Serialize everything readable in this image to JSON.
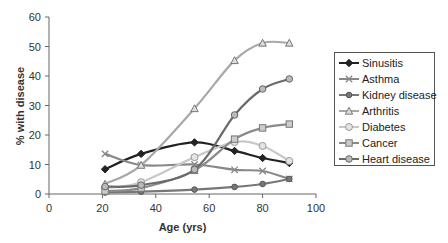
{
  "chart_data": {
    "type": "line",
    "title": "",
    "xlabel": "Age (yrs)",
    "ylabel": "% with disease",
    "xlim": [
      0,
      100
    ],
    "ylim": [
      0,
      60
    ],
    "xticks": [
      0,
      20,
      40,
      60,
      80,
      100
    ],
    "yticks": [
      0,
      10,
      20,
      30,
      40,
      50,
      60
    ],
    "grid": false,
    "legend_position": "right",
    "x": [
      21,
      34.5,
      54.5,
      69.5,
      80,
      90
    ],
    "series": [
      {
        "name": "Sinusitis",
        "color": "#222222",
        "marker": "diamond",
        "values": [
          8.4,
          13.6,
          17.5,
          14.6,
          12.2,
          10.5
        ]
      },
      {
        "name": "Asthma",
        "color": "#888888",
        "marker": "x",
        "values": [
          13.6,
          9.8,
          10.0,
          8.2,
          7.8,
          5.1
        ]
      },
      {
        "name": "Kidney disease",
        "color": "#777777",
        "marker": "circle-small",
        "values": [
          0.5,
          0.8,
          1.5,
          2.4,
          3.4,
          5.1
        ]
      },
      {
        "name": "Arthritis",
        "color": "#a8a8a8",
        "marker": "triangle",
        "values": [
          3.4,
          9.8,
          29.0,
          45.3,
          51.2,
          51.2
        ]
      },
      {
        "name": "Diabetes",
        "color": "#c8c8c8",
        "marker": "circle",
        "values": [
          2.0,
          4.0,
          12.5,
          17.6,
          16.3,
          11.2
        ]
      },
      {
        "name": "Cancer",
        "color": "#8a8a8a",
        "marker": "square",
        "values": [
          1.0,
          2.0,
          8.0,
          18.6,
          22.4,
          23.7
        ]
      },
      {
        "name": "Heart disease",
        "color": "#6a6a6a",
        "marker": "circle-line",
        "values": [
          2.5,
          3.0,
          8.3,
          26.8,
          35.6,
          39.0
        ]
      }
    ]
  }
}
